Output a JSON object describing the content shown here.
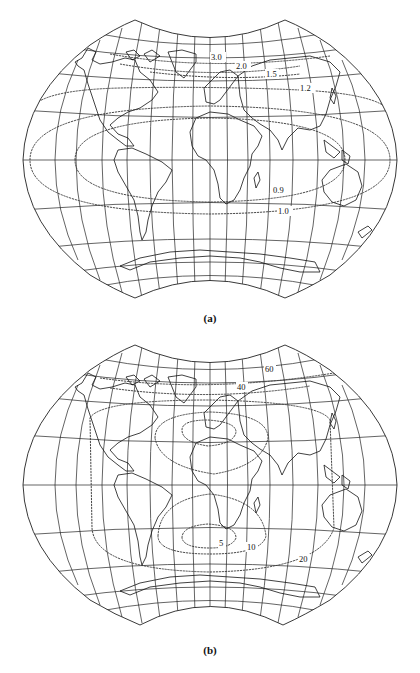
{
  "figure": {
    "panels": [
      {
        "id": "a",
        "caption": "(a)",
        "projection": "interrupted-concave-pole equal-area style world map",
        "contours": [
          {
            "value": "3.0",
            "label": "3.0"
          },
          {
            "value": "2.0",
            "label": "2.0"
          },
          {
            "value": "1.5",
            "label": "1.5"
          },
          {
            "value": "1.2",
            "label": "1.2"
          },
          {
            "value": "0.9",
            "label": "0.9"
          },
          {
            "value": "1.0",
            "label": "1.0"
          }
        ]
      },
      {
        "id": "b",
        "caption": "(b)",
        "projection": "interrupted-concave-pole equal-area style world map",
        "contours": [
          {
            "value": "60",
            "label": "60"
          },
          {
            "value": "40",
            "label": "40"
          },
          {
            "value": "20",
            "label": "20"
          },
          {
            "value": "10",
            "label": "10"
          },
          {
            "value": "5",
            "label": "5"
          }
        ]
      }
    ]
  },
  "colors": {
    "background": "#ffffff",
    "lines": "#222222"
  }
}
